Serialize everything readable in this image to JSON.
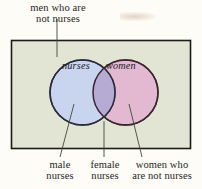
{
  "figure": {
    "type": "venn-diagram",
    "universe_label": {
      "line1": "men who are",
      "line2": "not nurses"
    },
    "sets": [
      {
        "id": "nurses",
        "label": "nurses",
        "fill": "#c8d4ee",
        "stroke": "#2b2a3f"
      },
      {
        "id": "women",
        "label": "women",
        "fill": "#e2b9d0",
        "stroke": "#3a2630"
      }
    ],
    "intersection": {
      "fill": "#b6abd2"
    },
    "universe_rect": {
      "fill": "#e3e5d4",
      "stroke": "#1c1c17"
    },
    "callouts": [
      {
        "id": "male-nurses",
        "line1": "male",
        "line2": "nurses"
      },
      {
        "id": "female-nurses",
        "line1": "female",
        "line2": "nurses"
      },
      {
        "id": "women-not-nurses",
        "line1": "women who",
        "line2": "are not nurses"
      }
    ],
    "background": "#fdfcf6"
  }
}
